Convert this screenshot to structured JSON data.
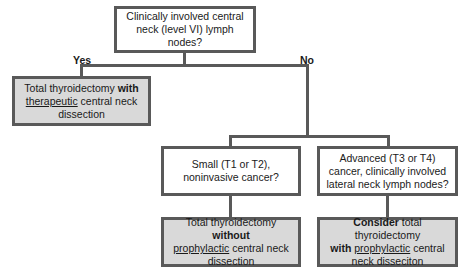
{
  "diagram": {
    "root": {
      "text": "Clinically involved central neck (level VI) lymph nodes?"
    },
    "branch_labels": {
      "yes": "Yes",
      "no": "No"
    },
    "yes_outcome": {
      "parts": {
        "a": "Total thyroidectomy ",
        "b": "with",
        "c": "therapeutic",
        "d": " central neck dissection"
      }
    },
    "no_left_question": {
      "text": "Small (T1 or T2), noninvasive cancer?"
    },
    "no_right_question": {
      "text": "Advanced (T3 or T4) cancer, clinically involved lateral neck lymph nodes?"
    },
    "left_outcome": {
      "parts": {
        "a": "Total thyroidectomy ",
        "b": "without",
        "c": "prophylactic",
        "d": " central neck dissection"
      }
    },
    "right_outcome": {
      "parts": {
        "a": "Consider",
        "b": " total thyroidectomy ",
        "c": "with",
        "d": "prophylactic",
        "e": " central neck disseciton"
      }
    },
    "colors": {
      "border": "#595959",
      "outcome_fill": "#d9d9d9",
      "question_fill": "#ffffff"
    }
  }
}
